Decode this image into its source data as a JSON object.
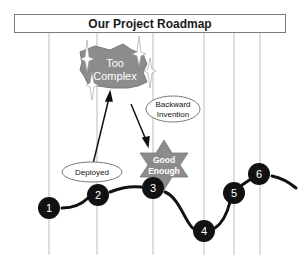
{
  "title": "Our Project Roadmap",
  "milestones": [
    {
      "label": "1",
      "x": 49,
      "y": 205
    },
    {
      "label": "2",
      "x": 98,
      "y": 194
    },
    {
      "label": "3",
      "x": 153,
      "y": 188
    },
    {
      "label": "4",
      "x": 204,
      "y": 231
    },
    {
      "label": "5",
      "x": 234,
      "y": 192
    },
    {
      "label": "6",
      "x": 259,
      "y": 174
    }
  ],
  "shapes": {
    "too_complex": {
      "line1": "Too",
      "line2": "Complex"
    },
    "good_enough": {
      "line1": "Good",
      "line2": "Enough"
    }
  },
  "callouts": {
    "backward_invention": {
      "line1": "Backward",
      "line2": "Invention"
    },
    "deployed": {
      "label": "Deployed"
    }
  },
  "colors": {
    "milestone_fill": "#111111",
    "shape_fill": "#8c8c8c",
    "gridline": "#bdbdbd",
    "curve": "#111111"
  }
}
